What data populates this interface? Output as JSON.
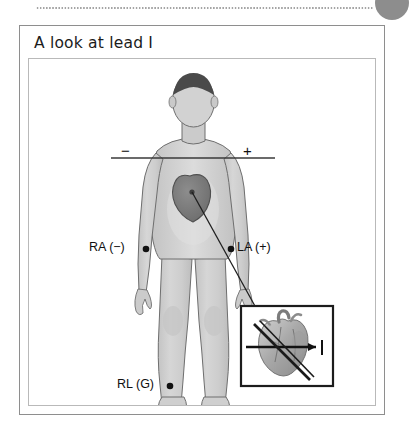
{
  "page": {
    "background_color": "#ffffff",
    "corner_marker": {
      "name": "page-bullet",
      "color": "#8d8d8d"
    },
    "divider": {
      "name": "dotted-rule",
      "color": "#9a9a9a"
    }
  },
  "figure": {
    "title": "A look at lead I",
    "border_color": "#8e8e8e",
    "panel_border_color": "#b9b9b9"
  },
  "illustration": {
    "subject": "anterior human body diagram",
    "body_fill": "#cfcfcf",
    "body_outline": "#6e6e6e",
    "hair_fill": "#4a4a4a",
    "heart_fill": "#7a7a7a",
    "electrodes": [
      {
        "id": "ra",
        "label": "RA (−)",
        "polarity": "negative",
        "site": "right arm"
      },
      {
        "id": "la",
        "label": "LA (+)",
        "polarity": "positive",
        "site": "left arm"
      },
      {
        "id": "rl",
        "label": "RL (G)",
        "polarity": "ground",
        "site": "right leg"
      }
    ],
    "axis_line": {
      "name": "lead-I-axis",
      "negative_sign": "−",
      "positive_sign": "+",
      "color": "#3a3a3a"
    },
    "inset": {
      "name": "heart-detail-inset",
      "border_color": "#1c1c1c",
      "content": "anatomical heart with lead I vector arrow",
      "arrow_color": "#111111"
    }
  }
}
